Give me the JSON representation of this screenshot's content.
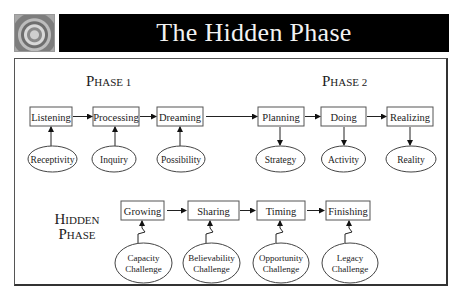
{
  "header": {
    "title": "The Hidden Phase",
    "thumbnail_icon": "camera-lens-icon"
  },
  "phase1": {
    "label_cap": "P",
    "label_rest": "HASE 1",
    "steps": [
      "Listening",
      "Processing",
      "Dreaming"
    ],
    "inputs": [
      "Receptivity",
      "Inquiry",
      "Possibility"
    ]
  },
  "phase2": {
    "label_cap": "P",
    "label_rest": "HASE 2",
    "steps": [
      "Planning",
      "Doing",
      "Realizing"
    ],
    "outputs": [
      "Strategy",
      "Activity",
      "Reality"
    ]
  },
  "hidden": {
    "label_line1_cap": "H",
    "label_line1_rest": "IDDEN",
    "label_line2_cap": "P",
    "label_line2_rest": "HASE",
    "steps": [
      "Growing",
      "Sharing",
      "Timing",
      "Finishing"
    ],
    "challenges": [
      {
        "line1": "Capacity",
        "line2": "Challenge"
      },
      {
        "line1": "Believability",
        "line2": "Challenge"
      },
      {
        "line1": "Opportunity",
        "line2": "Challenge"
      },
      {
        "line1": "Legacy",
        "line2": "Challenge"
      }
    ]
  },
  "colors": {
    "title_bar": "#000000",
    "title_text": "#f2f2f2",
    "stroke": "#444444"
  }
}
